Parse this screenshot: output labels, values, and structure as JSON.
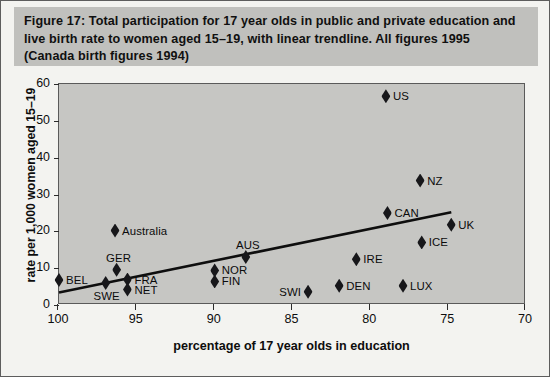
{
  "caption": {
    "lines": [
      "Figure 17:  Total participation for 17 year olds in public and private education and",
      "live birth rate to women aged 15–19, with linear trendline. All figures 1995",
      "(Canada birth figures 1994)"
    ]
  },
  "chart_data": {
    "type": "scatter",
    "title": "Figure 17:  Total participation for 17 year olds in public and private education and live birth rate to women aged 15–19, with linear trendline. All figures 1995 (Canada birth figures 1994)",
    "xlabel": "percentage of 17 year olds in education",
    "ylabel": "rate per 1,000 women aged 15–19",
    "xlim": [
      100,
      70
    ],
    "ylim": [
      0,
      60
    ],
    "x_axis_reversed": true,
    "xticks": [
      100,
      95,
      90,
      85,
      80,
      75,
      70
    ],
    "xticklabels": [
      "100",
      "95",
      "90",
      "85",
      "80",
      "75",
      "70"
    ],
    "yticks": [
      0,
      10,
      20,
      30,
      40,
      50,
      60
    ],
    "yticklabels": [
      "0",
      "10",
      "20",
      "30",
      "40",
      "50",
      "60"
    ],
    "grid": false,
    "legend": false,
    "marker_shape": "diamond",
    "marker_color": "#17171a",
    "plot_background": "#c6c6c3",
    "points": [
      {
        "label": "BEL",
        "x": 100.0,
        "y": 6.8,
        "label_pos": "right"
      },
      {
        "label": "SWE",
        "x": 97.0,
        "y": 6.0,
        "label_pos": "below"
      },
      {
        "label": "Australia",
        "x": 96.4,
        "y": 20.2,
        "label_pos": "right"
      },
      {
        "label": "GER",
        "x": 96.3,
        "y": 9.6,
        "label_pos": "above"
      },
      {
        "label": "FRA",
        "x": 95.6,
        "y": 6.9,
        "label_pos": "right"
      },
      {
        "label": "NET",
        "x": 95.6,
        "y": 4.2,
        "label_pos": "right"
      },
      {
        "label": "NOR",
        "x": 90.0,
        "y": 9.4,
        "label_pos": "right"
      },
      {
        "label": "FIN",
        "x": 90.0,
        "y": 6.4,
        "label_pos": "right"
      },
      {
        "label": "AUS",
        "x": 88.0,
        "y": 13.0,
        "label_pos": "above"
      },
      {
        "label": "SWI",
        "x": 84.0,
        "y": 3.6,
        "label_pos": "left"
      },
      {
        "label": "DEN",
        "x": 82.0,
        "y": 5.2,
        "label_pos": "right"
      },
      {
        "label": "IRE",
        "x": 80.9,
        "y": 12.4,
        "label_pos": "right"
      },
      {
        "label": "US",
        "x": 79.0,
        "y": 56.7,
        "label_pos": "right"
      },
      {
        "label": "CAN",
        "x": 78.9,
        "y": 25.0,
        "label_pos": "right"
      },
      {
        "label": "LUX",
        "x": 77.9,
        "y": 5.2,
        "label_pos": "right"
      },
      {
        "label": "NZ",
        "x": 76.8,
        "y": 33.8,
        "label_pos": "right"
      },
      {
        "label": "ICE",
        "x": 76.7,
        "y": 17.0,
        "label_pos": "right"
      },
      {
        "label": "UK",
        "x": 74.8,
        "y": 21.8,
        "label_pos": "right"
      }
    ],
    "trendline": {
      "type": "linear",
      "x_start": 100.0,
      "y_start": 3.4,
      "x_end": 74.8,
      "y_end": 25.2
    }
  }
}
